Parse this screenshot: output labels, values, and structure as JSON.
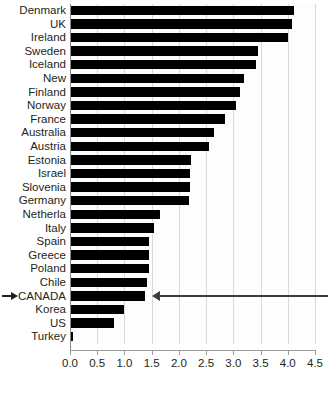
{
  "chart_data": {
    "type": "bar",
    "orientation": "horizontal",
    "title": "",
    "subtitle": "",
    "xlabel": "",
    "ylabel": "",
    "xlim": [
      0.0,
      4.5
    ],
    "xticks": [
      "0.0",
      "0.5",
      "1.0",
      "1.5",
      "2.0",
      "2.5",
      "3.0",
      "3.5",
      "4.0",
      "4.5"
    ],
    "xtick_values": [
      0.0,
      0.5,
      1.0,
      1.5,
      2.0,
      2.5,
      3.0,
      3.5,
      4.0,
      4.5
    ],
    "grid": true,
    "grid_axis": "x",
    "legend": null,
    "bar_color": "#000000",
    "categories": [
      "Denmark",
      "UK",
      "Ireland",
      "Sweden",
      "Iceland",
      "New",
      "Finland",
      "Norway",
      "France",
      "Australia",
      "Austria",
      "Estonia",
      "Israel",
      "Slovenia",
      "Germany",
      "Netherla",
      "Italy",
      "Spain",
      "Greece",
      "Poland",
      "Chile",
      "CANADA",
      "Korea",
      "US",
      "Turkey"
    ],
    "values": [
      4.12,
      4.08,
      4.0,
      3.45,
      3.42,
      3.2,
      3.12,
      3.05,
      2.85,
      2.65,
      2.55,
      2.22,
      2.2,
      2.2,
      2.18,
      1.65,
      1.55,
      1.45,
      1.45,
      1.45,
      1.42,
      1.38,
      1.0,
      0.8,
      0.05
    ],
    "highlighted_category": "CANADA",
    "annotations": [
      {
        "name": "canada-pointer-arrow",
        "type": "arrow",
        "direction": "left",
        "target_category": "CANADA",
        "description": "Long horizontal arrow from right edge pointing left to the end of the CANADA bar"
      },
      {
        "name": "canada-label-arrow",
        "type": "arrow",
        "direction": "right",
        "target_category": "CANADA",
        "description": "Small arrow at left margin pointing right toward the CANADA label"
      }
    ]
  },
  "axis": {
    "tick_color": "#9a9a9a",
    "grid_color": "#d9d9d9",
    "text_color": "#231f20"
  },
  "caption_remnant": ""
}
